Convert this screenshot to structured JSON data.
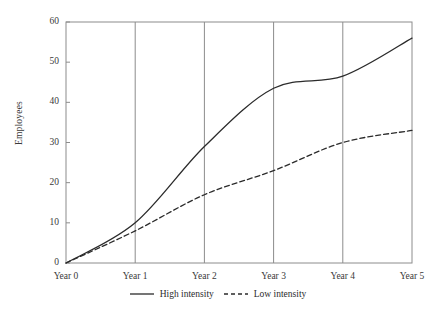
{
  "chart_data": {
    "type": "line",
    "title": "",
    "xlabel": "",
    "ylabel": "Employees",
    "x": [
      0,
      1,
      2,
      3,
      4,
      5
    ],
    "categories": [
      "Year 0",
      "Year 1",
      "Year 2",
      "Year 3",
      "Year 4",
      "Year 5"
    ],
    "xtick_labels": [
      "Year 0",
      "Year 1",
      "Year 2",
      "Year 3",
      "Year 4",
      "Year 5"
    ],
    "ytick_labels": [
      "0",
      "10",
      "20",
      "30",
      "40",
      "50",
      "60"
    ],
    "yticks": [
      0,
      10,
      20,
      30,
      40,
      50,
      60
    ],
    "ylim": [
      0,
      60
    ],
    "xlim": [
      0,
      5
    ],
    "grid": "vertical-only",
    "legend_position": "bottom-center",
    "series": [
      {
        "name": "High intensity",
        "style": "solid",
        "color": "#2b2b2b",
        "values": [
          0,
          10,
          29,
          43.5,
          46.5,
          56
        ]
      },
      {
        "name": "Low intensity",
        "style": "dashed",
        "color": "#2b2b2b",
        "values": [
          0,
          8,
          17,
          23,
          30,
          33
        ]
      }
    ]
  },
  "axis": {
    "y_title": "Employees"
  },
  "legend": {
    "items": [
      {
        "label": "High intensity",
        "style": "solid"
      },
      {
        "label": "Low intensity",
        "style": "dashed"
      }
    ]
  },
  "colors": {
    "line": "#2b2b2b",
    "frame": "#8c8c8c",
    "gridline": "#8c8c8c",
    "text": "#3a3a3a",
    "background": "#ffffff"
  }
}
